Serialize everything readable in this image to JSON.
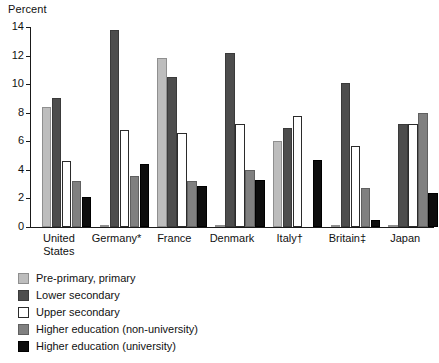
{
  "chart_data": {
    "type": "bar",
    "title": "",
    "subtitle": "",
    "xlabel": "",
    "ylabel": "Percent",
    "ylim": [
      0,
      14
    ],
    "ytick_step": 2,
    "yticks": [
      0,
      2,
      4,
      6,
      8,
      10,
      12,
      14
    ],
    "grid": false,
    "legend_position": "below",
    "categories": [
      "United\nStates",
      "Germany*",
      "France",
      "Denmark",
      "Italy†",
      "Britain‡",
      "Japan"
    ],
    "series": [
      {
        "name": "Pre-primary, primary",
        "color": "#bdbdbd",
        "values": [
          8.4,
          0.1,
          11.8,
          0.1,
          6.0,
          0.1,
          0.1
        ]
      },
      {
        "name": "Lower secondary",
        "color": "#4d4d4d",
        "values": [
          9.0,
          13.8,
          10.5,
          12.2,
          6.9,
          10.1,
          7.2
        ]
      },
      {
        "name": "Upper secondary",
        "color": "#ffffff",
        "values": [
          4.6,
          6.8,
          6.6,
          7.2,
          7.8,
          5.7,
          7.2
        ]
      },
      {
        "name": "Higher education (non-university)",
        "color": "#808080",
        "values": [
          3.2,
          3.6,
          3.2,
          4.0,
          0.0,
          2.7,
          8.0
        ]
      },
      {
        "name": "Higher education (university)",
        "color": "#0d0d0d",
        "values": [
          2.1,
          4.4,
          2.9,
          3.3,
          4.7,
          0.5,
          2.4
        ]
      }
    ]
  },
  "axis": {
    "y_title": "Percent"
  }
}
